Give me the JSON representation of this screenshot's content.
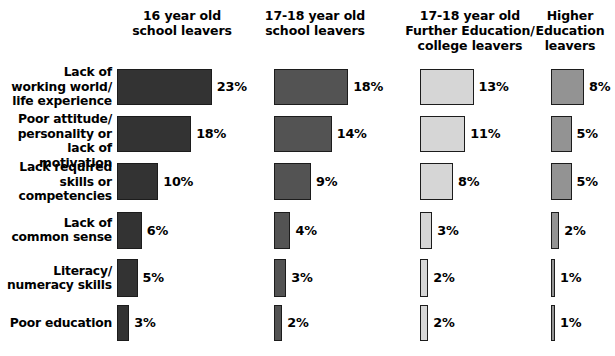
{
  "chart_data": {
    "type": "bar",
    "title": "",
    "subtitle": "",
    "xlabel": "",
    "ylabel": "",
    "grid": false,
    "legend_position": "none",
    "orientation": "horizontal",
    "value_suffix": "%",
    "axis_max_percent": 23,
    "categories": [
      "Lack of\nworking world/\nlife experience",
      "Poor attitude/\npersonality or\nlack of motivation",
      "Lack required\nskills or\ncompetencies",
      "Lack of\ncommon sense",
      "Literacy/\nnumeracy skills",
      "Poor education"
    ],
    "series": [
      {
        "name": "16 year old\nschool leavers",
        "color": "#333333",
        "values": [
          23,
          18,
          10,
          6,
          5,
          3
        ],
        "labels": [
          "23%",
          "18%",
          "10%",
          "6%",
          "5%",
          "3%"
        ]
      },
      {
        "name": "17-18 year old\nschool leavers",
        "color": "#535353",
        "values": [
          18,
          14,
          9,
          4,
          3,
          2
        ],
        "labels": [
          "18%",
          "14%",
          "9%",
          "4%",
          "3%",
          "2%"
        ]
      },
      {
        "name": "17-18 year old\nFurther Education/\ncollege leavers",
        "color": "#d6d6d6",
        "values": [
          13,
          11,
          8,
          3,
          2,
          2
        ],
        "labels": [
          "13%",
          "11%",
          "8%",
          "3%",
          "2%",
          "2%"
        ]
      },
      {
        "name": "Higher\nEducation\nleavers",
        "color": "#939393",
        "values": [
          8,
          5,
          5,
          2,
          1,
          1
        ],
        "labels": [
          "8%",
          "5%",
          "5%",
          "2%",
          "1%",
          "1%"
        ]
      }
    ]
  },
  "layout": {
    "column_origins_px": [
      117,
      274,
      420,
      551
    ],
    "row_tops_px": [
      69,
      116,
      163,
      212,
      259,
      305
    ],
    "row_heights_px": [
      36,
      36,
      37,
      37,
      38,
      36
    ],
    "label_centers_px": [
      87,
      134,
      182,
      230,
      278,
      323
    ],
    "px_per_percent": 4.12,
    "header_centers_px": [
      182,
      315,
      470,
      570
    ],
    "border_color": "#1c1c1c"
  }
}
